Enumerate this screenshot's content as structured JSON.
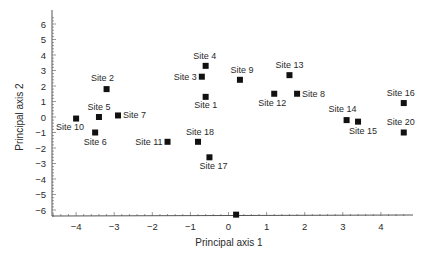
{
  "chart_data": {
    "type": "scatter",
    "title": "",
    "xlabel": "Principal axis 1",
    "ylabel": "Principal axis 2",
    "xlim": [
      -4.6,
      4.8
    ],
    "ylim": [
      -6.4,
      6.6
    ],
    "xticks": [
      -4,
      -3,
      -2,
      -1,
      0,
      1,
      2,
      3,
      4
    ],
    "yticks": [
      6,
      5,
      4,
      3,
      2,
      1,
      0,
      -1,
      -2,
      -3,
      -4,
      -5,
      -6
    ],
    "xtick_labels": [
      "−4",
      "−3",
      "−2",
      "−1",
      "0",
      "1",
      "2",
      "3",
      "4"
    ],
    "ytick_labels": [
      "6",
      "5",
      "4",
      "3",
      "2",
      "1",
      "0",
      "−1",
      "−2",
      "−3",
      "−4",
      "−5",
      "−6"
    ],
    "grid": false,
    "legend": "none",
    "marker": "square",
    "marker_color": "#111111",
    "points": [
      {
        "label": "Site 1",
        "x": -0.6,
        "y": 1.3,
        "lx": 0,
        "ly": 11,
        "anchor": "middle"
      },
      {
        "label": "Site 2",
        "x": -3.2,
        "y": 1.8,
        "lx": -4,
        "ly": -8,
        "anchor": "middle"
      },
      {
        "label": "Site 3",
        "x": -0.7,
        "y": 2.6,
        "lx": -5,
        "ly": 3,
        "anchor": "end"
      },
      {
        "label": "Site 4",
        "x": -0.6,
        "y": 3.3,
        "lx": -1,
        "ly": -7,
        "anchor": "middle"
      },
      {
        "label": "Site 5",
        "x": -3.4,
        "y": 0.0,
        "lx": 0,
        "ly": -7,
        "anchor": "middle"
      },
      {
        "label": "Site 6",
        "x": -3.5,
        "y": -1.0,
        "lx": 0,
        "ly": 12,
        "anchor": "middle"
      },
      {
        "label": "Site 7",
        "x": -2.9,
        "y": 0.1,
        "lx": 5,
        "ly": 3,
        "anchor": "start"
      },
      {
        "label": "Site 8",
        "x": 1.8,
        "y": 1.5,
        "lx": 5,
        "ly": 3,
        "anchor": "start"
      },
      {
        "label": "Site 9",
        "x": 0.3,
        "y": 2.4,
        "lx": 2,
        "ly": -7,
        "anchor": "middle"
      },
      {
        "label": "Site 10",
        "x": -4.0,
        "y": -0.1,
        "lx": -6,
        "ly": 11,
        "anchor": "middle"
      },
      {
        "label": "Site 11",
        "x": -1.6,
        "y": -1.6,
        "lx": -5,
        "ly": 3,
        "anchor": "end"
      },
      {
        "label": "Site 12",
        "x": 1.2,
        "y": 1.5,
        "lx": -2,
        "ly": 12,
        "anchor": "middle"
      },
      {
        "label": "Site 13",
        "x": 1.6,
        "y": 2.7,
        "lx": 0,
        "ly": -7,
        "anchor": "middle"
      },
      {
        "label": "Site 14",
        "x": 3.1,
        "y": -0.2,
        "lx": -4,
        "ly": -8,
        "anchor": "middle"
      },
      {
        "label": "Site 15",
        "x": 3.4,
        "y": -0.3,
        "lx": 5,
        "ly": 12,
        "anchor": "middle"
      },
      {
        "label": "Site 16",
        "x": 4.6,
        "y": 0.9,
        "lx": -3,
        "ly": -7,
        "anchor": "middle"
      },
      {
        "label": "Site 17",
        "x": -0.5,
        "y": -2.6,
        "lx": 4,
        "ly": 12,
        "anchor": "middle"
      },
      {
        "label": "Site 18",
        "x": -0.8,
        "y": -1.6,
        "lx": 2,
        "ly": -7,
        "anchor": "middle"
      },
      {
        "label": "Site 20",
        "x": 4.6,
        "y": -1.0,
        "lx": -3,
        "ly": -8,
        "anchor": "middle"
      },
      {
        "label": "",
        "x": 0.2,
        "y": -6.3,
        "lx": 0,
        "ly": 0,
        "anchor": "middle"
      }
    ]
  }
}
